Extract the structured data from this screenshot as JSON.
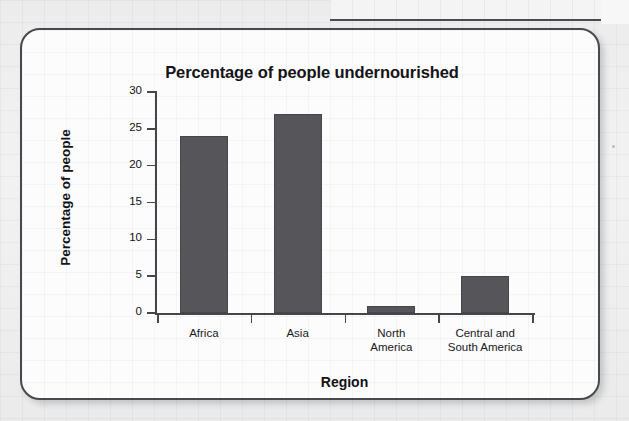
{
  "chart_data": {
    "type": "bar",
    "title": "Percentage of people undernourished",
    "xlabel": "Region",
    "ylabel": "Percentage of people",
    "categories": [
      "Africa",
      "Asia",
      "North America",
      "Central and South America"
    ],
    "category_lines": [
      [
        "Africa"
      ],
      [
        "Asia"
      ],
      [
        "North",
        "America"
      ],
      [
        "Central and",
        "South America"
      ]
    ],
    "values": [
      24,
      27,
      1,
      5
    ],
    "ylim": [
      0,
      30
    ],
    "yticks": [
      0,
      5,
      10,
      15,
      20,
      25,
      30
    ],
    "ytick_labels": [
      "0",
      "5",
      "10",
      "15",
      "20",
      "25",
      "30"
    ],
    "grid": false,
    "legend": "none",
    "bar_color": "#55555a",
    "axis_color": "#46464a",
    "plot_background": "#fcfcfd"
  },
  "figure": {
    "card_border_color": "#49494d",
    "page_background": "#ececed"
  }
}
